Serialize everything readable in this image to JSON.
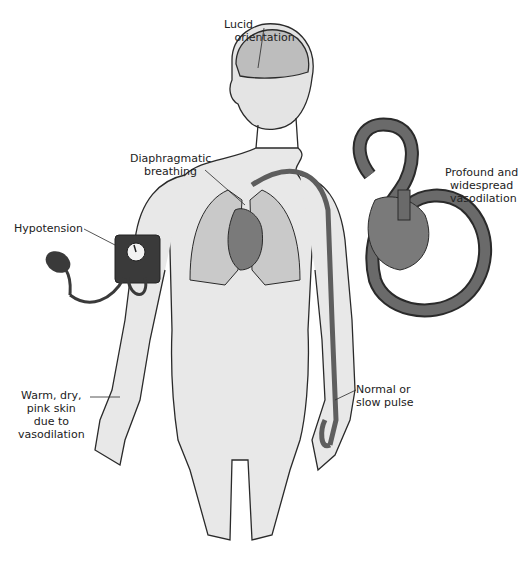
{
  "figure": {
    "labels": {
      "lucid": "Lucid\n   orientation",
      "diaphragm": "Diaphragmatic\n    breathing",
      "hypotension": "Hypotension",
      "vasodilation": "Profound and\nwidespread\n vasodilation",
      "skin": "Warm, dry,\npink skin\ndue to\nvasodilation",
      "pulse": "Normal or\nslow pulse"
    },
    "colors": {
      "outline": "#2a2a2a",
      "skin": "#e4e4e4",
      "brain": "#bdbdbd",
      "lung": "#c9c9c9",
      "heart": "#7a7a7a",
      "vessel": "#5e5e5e",
      "cuff": "#3a3a3a"
    }
  }
}
